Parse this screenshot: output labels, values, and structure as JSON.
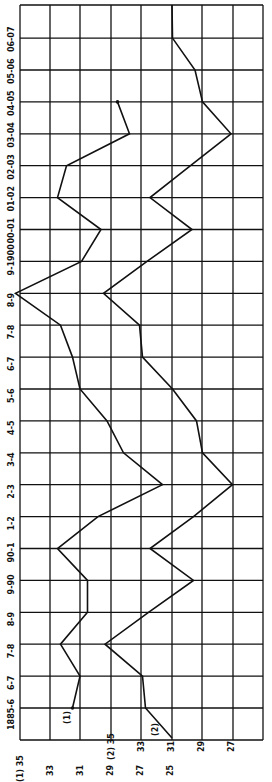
{
  "chart_data": {
    "type": "line",
    "orientation": "rotated-90-ccw",
    "title": "",
    "xlabel": "",
    "ylabel": "",
    "categories": [
      "1885-6",
      "6-7",
      "7-8",
      "8-9",
      "9-90",
      "90-1",
      "1-2",
      "2-3",
      "3-4",
      "4-5",
      "5-6",
      "6-7",
      "7-8",
      "8-9",
      "9-1900",
      "00-01",
      "01-02",
      "02-03",
      "03-04",
      "04-05",
      "05-06",
      "06-07"
    ],
    "series": [
      {
        "name": "(1)",
        "axis_label": "(1)",
        "values": [
          31.5,
          31.0,
          32.3,
          30.5,
          30.5,
          32.5,
          29.8,
          25.5,
          28.1,
          29.2,
          31.0,
          31.5,
          32.3,
          35.3,
          30.9,
          29.6,
          32.5,
          31.9,
          27.7,
          28.5,
          null,
          null
        ]
      },
      {
        "name": "(2)",
        "axis_label": "(2)",
        "values": [
          32.7,
          32.9,
          35.4,
          32.5,
          29.5,
          32.4,
          29.5,
          26.9,
          28.9,
          29.3,
          30.9,
          32.9,
          33.1,
          35.5,
          32.6,
          29.6,
          32.4,
          29.7,
          27.0,
          28.9,
          29.4,
          30.9
        ]
      }
    ],
    "axes": {
      "axis1": {
        "label": "(1)",
        "ticks": [
          "35",
          "33",
          "31",
          "29",
          "27",
          "25"
        ],
        "range": [
          25,
          35
        ]
      },
      "axis2": {
        "label": "(2)",
        "ticks": [
          "35",
          "33",
          "31",
          "29",
          "27"
        ],
        "range": [
          27,
          35
        ]
      }
    },
    "grid": true,
    "legend": "inline labels (1) and (2) near start of lines"
  },
  "labels": {
    "series1_marker": "(1)",
    "series2_marker": "(2)",
    "axis1_prefix": "(1)",
    "axis2_prefix": "(2)"
  }
}
